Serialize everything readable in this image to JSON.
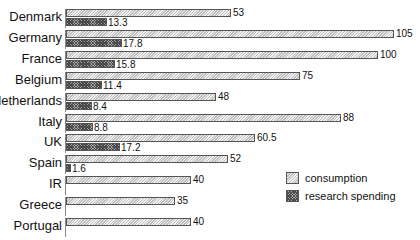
{
  "chart_data": {
    "type": "bar",
    "orientation": "horizontal",
    "title": "",
    "xlabel": "",
    "ylabel": "",
    "grid": false,
    "legend_position": "lower right",
    "categories": [
      "Denmark",
      "Germany",
      "France",
      "Belgium",
      "Netherlands",
      "Italy",
      "UK",
      "Spain",
      "IR",
      "Greece",
      "Portugal"
    ],
    "series": [
      {
        "name": "consumption",
        "values": [
          53,
          105,
          100,
          75,
          48,
          88,
          60.5,
          52,
          40,
          35,
          40
        ]
      },
      {
        "name": "research spending",
        "values": [
          13.3,
          17.8,
          15.8,
          11.4,
          8.4,
          8.8,
          17.2,
          1.6,
          null,
          null,
          null
        ]
      }
    ],
    "value_labels": {
      "consumption": [
        "53",
        "105",
        "100",
        "75",
        "48",
        "88",
        "60.5",
        "52",
        "40",
        "35",
        "40"
      ],
      "research spending": [
        "13.3",
        "17.8",
        "15.8",
        "11.4",
        "8.4",
        "8.8",
        "17.2",
        "1.6",
        "",
        "",
        ""
      ]
    },
    "xlim": [
      0,
      105
    ]
  },
  "legend": {
    "items": [
      {
        "label": "consumption",
        "pattern": "light-hatch"
      },
      {
        "label": "research spending",
        "pattern": "dark-crosshatch"
      }
    ]
  },
  "layout": {
    "origin_x": 66,
    "px_per_unit": 3.12,
    "first_row_y": 9,
    "row_pitch": 20.9,
    "bar_height": 8
  }
}
